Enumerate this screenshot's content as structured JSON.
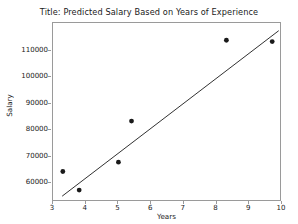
{
  "chart_data": {
    "type": "scatter",
    "title": "Title: Predicted Salary Based on Years of Experience",
    "xlabel": "Years",
    "ylabel": "Salary",
    "xlim": [
      3,
      10
    ],
    "ylim": [
      53000,
      120500
    ],
    "grid": false,
    "legend": null,
    "xticks": [
      3,
      4,
      5,
      6,
      7,
      8,
      9,
      10
    ],
    "xtick_labels": [
      "3",
      "4",
      "5",
      "6",
      "7",
      "8",
      "9",
      "10"
    ],
    "yticks": [
      60000,
      70000,
      80000,
      90000,
      100000,
      110000
    ],
    "ytick_labels": [
      "60000",
      "70000",
      "80000",
      "90000",
      "100000",
      "110000"
    ],
    "series": [
      {
        "name": "observed-salaries",
        "type": "scatter",
        "marker": "circle",
        "color": "#1a1a1a",
        "points": [
          {
            "x": 3.3,
            "y": 64500
          },
          {
            "x": 3.8,
            "y": 57500
          },
          {
            "x": 5.0,
            "y": 68000
          },
          {
            "x": 5.4,
            "y": 83500
          },
          {
            "x": 8.3,
            "y": 114000
          },
          {
            "x": 9.7,
            "y": 113500
          }
        ]
      },
      {
        "name": "regression-line",
        "type": "line",
        "color": "#1a1a1a",
        "points": [
          {
            "x": 3.28,
            "y": 55200
          },
          {
            "x": 9.9,
            "y": 117600
          }
        ]
      }
    ]
  },
  "figure": {
    "background_color": "#ffffff",
    "axes_color": "#9a9a9a",
    "text_color": "#1a1a1a"
  }
}
